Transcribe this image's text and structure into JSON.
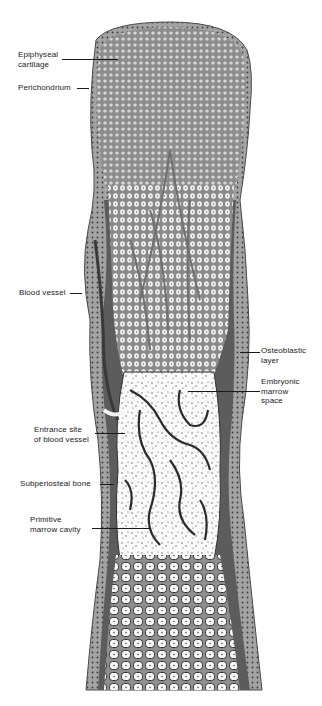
{
  "figure": {
    "colors": {
      "background": "#ffffff",
      "cartilage_matrix": "#8d8d8d",
      "cartilage_cells": "#f4f4f4",
      "bone_tissue": "#5c5c5c",
      "periosteum": "#9a9a9a",
      "marrow_space": "#f8f8f8",
      "label_text": "#222222"
    }
  },
  "labels": [
    {
      "id": "epiphyseal-cartilage",
      "text": "Epiphyseal\ncartilage",
      "side": "left"
    },
    {
      "id": "perichondrium",
      "text": "Perichondrium",
      "side": "left"
    },
    {
      "id": "blood-vessel",
      "text": "Blood vessel",
      "side": "left"
    },
    {
      "id": "osteoblastic-layer",
      "text": "Osteoblastic\nlayer",
      "side": "right"
    },
    {
      "id": "embryonic-marrow-space",
      "text": "Embryonic\nmarrow\nspace",
      "side": "right"
    },
    {
      "id": "entrance-site-blood-vessel",
      "text": "Entrance site\nof blood vessel",
      "side": "left"
    },
    {
      "id": "subperiosteal-bone",
      "text": "Subperiosteal bone",
      "side": "left"
    },
    {
      "id": "primitive-marrow-cavity",
      "text": "Primitive\nmarrow cavity",
      "side": "left"
    }
  ]
}
